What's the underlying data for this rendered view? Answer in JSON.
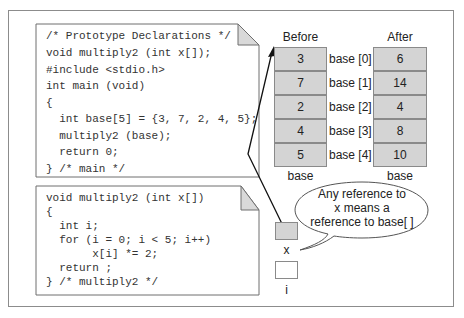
{
  "code_main": {
    "lines": [
      "/* Prototype Declarations */",
      "void multiply2 (int x[]);",
      "#include <stdio.h>",
      "int main (void)",
      "{",
      "  int base[5] = {3, 7, 2, 4, 5};",
      "  multiply2 (base);",
      "  return 0;",
      "} /* main */"
    ]
  },
  "code_func": {
    "lines": [
      "void multiply2 (int x[])",
      "{",
      "  int i;",
      "  for (i = 0; i < 5; i++)",
      "       x[i] *= 2;",
      "  return ;",
      "} /* multiply2 */"
    ]
  },
  "memory": {
    "before_label": "Before",
    "after_label": "After",
    "before_values": [
      "3",
      "7",
      "2",
      "4",
      "5"
    ],
    "after_values": [
      "6",
      "14",
      "4",
      "8",
      "10"
    ],
    "index_labels": [
      "base [0]",
      "base [1]",
      "base [2]",
      "base [3]",
      "base [4]"
    ],
    "before_footer": "base",
    "after_footer": "base"
  },
  "callout": {
    "line1": "Any reference to",
    "line2": "x  means a",
    "line3": "reference to base[ ]"
  },
  "variables": {
    "x_label": "x",
    "i_label": "i"
  },
  "colors": {
    "cell_fill": "#d4d4d4",
    "cell_border": "#8a8a8a",
    "fold_fill": "#d9d9d9"
  }
}
